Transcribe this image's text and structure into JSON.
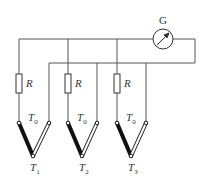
{
  "diagram": {
    "type": "thermocouple-circuit",
    "galvanometer": {
      "label": "G"
    },
    "branches": [
      {
        "resistor_label": "R",
        "reference_junction_label": "T",
        "reference_junction_sub": "0",
        "measuring_junction_label": "T",
        "measuring_junction_sub": "1"
      },
      {
        "resistor_label": "R",
        "reference_junction_label": "T",
        "reference_junction_sub": "0",
        "measuring_junction_label": "T",
        "measuring_junction_sub": "2"
      },
      {
        "resistor_label": "R",
        "reference_junction_label": "T",
        "reference_junction_sub": "0",
        "measuring_junction_label": "T",
        "measuring_junction_sub": "3"
      }
    ],
    "colors": {
      "wire": "#555555",
      "black_leg": "#111111",
      "white_leg_outline": "#222222"
    }
  }
}
